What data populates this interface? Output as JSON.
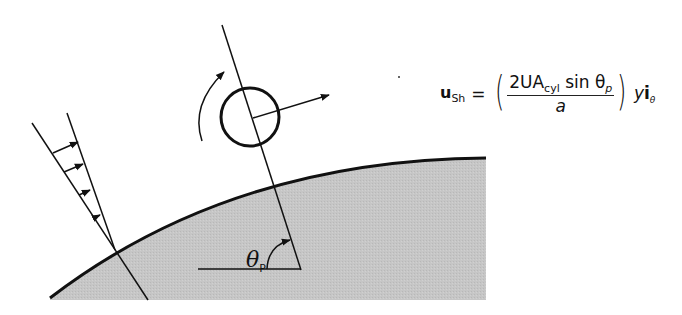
{
  "figure": {
    "colors": {
      "wall_fill": "#c4c4c4",
      "line": "#111111",
      "background": "#ffffff"
    }
  },
  "formula": {
    "lhs_symbol": "u",
    "lhs_subscript": "Sh",
    "equals": "=",
    "numerator_prefix": "2UA",
    "numerator_subscript": "cyl",
    "numerator_suffix": " sin θ",
    "numerator_theta_subscript": "p",
    "denominator": "a",
    "tail_var": "y",
    "tail_unit": "i",
    "tail_unit_subscript": "θ"
  },
  "labels": {
    "angle_symbol": "θ",
    "angle_subscript": "P"
  },
  "elements": {
    "shear_profile_arrows": 4,
    "rotation_arrow": "counterclockwise",
    "velocity_arrow": "outward from cylinder center"
  }
}
